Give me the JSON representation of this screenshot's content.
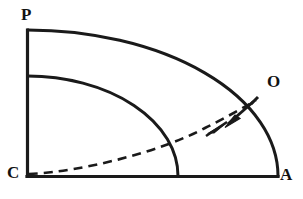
{
  "figure": {
    "kind": "geometric-diagram",
    "background_color": "#ffffff",
    "stroke_color": "#1a1a1a",
    "labels": {
      "top_left": "P",
      "bottom_left": "C",
      "bottom_right": "A",
      "arc_point": "O"
    },
    "geometry": {
      "center": {
        "x": 27,
        "y": 176
      },
      "outer_radius_x": 251,
      "outer_radius_y": 146,
      "inner_radius_x": 151,
      "inner_radius_y": 100,
      "vertical_axis": {
        "x": 27,
        "y_top": 30,
        "y_bottom": 176
      },
      "horizontal_axis": {
        "y": 176,
        "x_left": 27,
        "x_right": 278
      }
    },
    "annotations": {
      "dashed_curve": "curve from C rising to the right toward point O on the outer arc",
      "arrow_outward": "arrowhead on dashed curve pointing up-right",
      "arrow_inward": "solid segment from the outer arc with arrowhead pointing down-left"
    }
  }
}
